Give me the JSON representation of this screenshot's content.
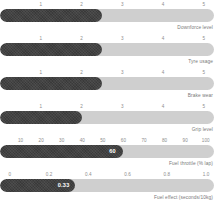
{
  "chart_data": {
    "type": "bar",
    "title": "",
    "subtitle": "",
    "xlabel": "",
    "ylabel": "",
    "grid": false,
    "legend": null,
    "orientation": "horizontal",
    "style": "bullet-bars",
    "colors": {
      "fill": "#3a3a3a",
      "track": "#cfcfcf",
      "tick_text": "#8d8d8d",
      "caption_text": "#7a7a7a",
      "value_text": "#ffffff",
      "background": "#ffffff"
    },
    "categories": [
      "Downforce level",
      "Tyre usage",
      "Brake wear",
      "Grip level",
      "Fuel throttle (% lap)",
      "Fuel effect (seconds/10kg)",
      "Fuel consumption (kg/lap)"
    ],
    "values": [
      2.5,
      2.5,
      2.5,
      2.0,
      60,
      0.33,
      1.85
    ],
    "series": [
      {
        "name": "value",
        "values": [
          2.5,
          2.5,
          2.5,
          2.0,
          60,
          0.33,
          1.85
        ]
      }
    ],
    "rows": [
      {
        "label": "Downforce level",
        "value": 2.5,
        "value_label": "",
        "show_value": false,
        "axis_min": 0,
        "axis_max": 5.25,
        "ticks": [
          {
            "label": "1",
            "pos": 1
          },
          {
            "label": "2",
            "pos": 2
          },
          {
            "label": "3",
            "pos": 3
          },
          {
            "label": "4",
            "pos": 4
          },
          {
            "label": "5",
            "pos": 5
          }
        ]
      },
      {
        "label": "Tyre usage",
        "value": 2.5,
        "value_label": "",
        "show_value": false,
        "axis_min": 0,
        "axis_max": 5.25,
        "ticks": [
          {
            "label": "1",
            "pos": 1
          },
          {
            "label": "2",
            "pos": 2
          },
          {
            "label": "3",
            "pos": 3
          },
          {
            "label": "4",
            "pos": 4
          },
          {
            "label": "5",
            "pos": 5
          }
        ]
      },
      {
        "label": "Brake wear",
        "value": 2.5,
        "value_label": "",
        "show_value": false,
        "axis_min": 0,
        "axis_max": 5.25,
        "ticks": [
          {
            "label": "1",
            "pos": 1
          },
          {
            "label": "2",
            "pos": 2
          },
          {
            "label": "3",
            "pos": 3
          },
          {
            "label": "4",
            "pos": 4
          },
          {
            "label": "5",
            "pos": 5
          }
        ]
      },
      {
        "label": "Grip level",
        "value": 2.0,
        "value_label": "",
        "show_value": false,
        "axis_min": 0,
        "axis_max": 5.25,
        "ticks": [
          {
            "label": "1",
            "pos": 1
          },
          {
            "label": "2",
            "pos": 2
          },
          {
            "label": "3",
            "pos": 3
          },
          {
            "label": "4",
            "pos": 4
          },
          {
            "label": "5",
            "pos": 5
          }
        ]
      },
      {
        "label": "Fuel throttle (% lap)",
        "value": 60,
        "value_label": "60",
        "show_value": true,
        "axis_min": 0,
        "axis_max": 104,
        "ticks": [
          {
            "label": "10",
            "pos": 10
          },
          {
            "label": "20",
            "pos": 20
          },
          {
            "label": "30",
            "pos": 30
          },
          {
            "label": "40",
            "pos": 40
          },
          {
            "label": "50",
            "pos": 50
          },
          {
            "label": "60",
            "pos": 60
          },
          {
            "label": "70",
            "pos": 70
          },
          {
            "label": "80",
            "pos": 80
          },
          {
            "label": "90",
            "pos": 90
          },
          {
            "label": "100",
            "pos": 100
          }
        ]
      },
      {
        "label": "Fuel effect (seconds/10kg)",
        "value": 0.33,
        "value_label": "0.33",
        "show_value": true,
        "axis_min": -0.05,
        "axis_max": 1.04,
        "ticks": [
          {
            "label": "0",
            "pos": 0
          },
          {
            "label": "0.2",
            "pos": 0.2
          },
          {
            "label": "0.4",
            "pos": 0.4
          },
          {
            "label": "0.6",
            "pos": 0.6
          },
          {
            "label": "0.8",
            "pos": 0.8
          },
          {
            "label": "1.0",
            "pos": 1.0
          }
        ]
      },
      {
        "label": "Fuel consumption (kg/lap)",
        "value": 1.85,
        "value_label": "1.85",
        "show_value": true,
        "axis_min": 0.82,
        "axis_max": 4.6,
        "ticks": [
          {
            "label": "1.0",
            "pos": 1.0
          },
          {
            "label": "1.5",
            "pos": 1.5
          },
          {
            "label": "2.0",
            "pos": 2.0
          },
          {
            "label": "2.5",
            "pos": 2.5
          },
          {
            "label": "3.0",
            "pos": 3.0
          },
          {
            "label": "3.5",
            "pos": 3.5
          },
          {
            "label": "4.0",
            "pos": 4.0
          },
          {
            "label": "4.5",
            "pos": 4.5
          }
        ]
      }
    ]
  }
}
